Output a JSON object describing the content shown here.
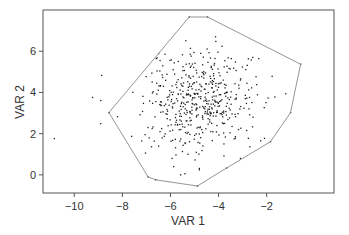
{
  "chart_data": {
    "type": "scatter",
    "title": "",
    "xlabel": "VAR 1",
    "ylabel": "VAR 2",
    "xlim": [
      -11.3,
      0.8
    ],
    "ylim": [
      -0.88,
      8.0
    ],
    "xticks": [
      -10,
      -8,
      -6,
      -4,
      -2
    ],
    "yticks": [
      0,
      2,
      4,
      6
    ],
    "grid": false,
    "legend": null,
    "point_color": "#222222",
    "hull_color": "#888888",
    "frame_color": "#555555",
    "cluster": {
      "description": "approx. bivariate normal cloud of ~500 points",
      "count": 500,
      "mean": [
        -4.75,
        3.55
      ],
      "sd": [
        1.15,
        1.25
      ],
      "seed": 7
    },
    "outliers": [
      {
        "x": -10.83,
        "y": 1.76
      },
      {
        "x": -9.24,
        "y": 3.76
      },
      {
        "x": -8.9,
        "y": 3.61
      },
      {
        "x": -8.86,
        "y": 4.83
      },
      {
        "x": -8.9,
        "y": 2.49
      }
    ],
    "hull": [
      {
        "x": -5.22,
        "y": 7.66
      },
      {
        "x": -4.46,
        "y": 7.66
      },
      {
        "x": -0.59,
        "y": 5.37
      },
      {
        "x": -1.01,
        "y": 3.02
      },
      {
        "x": -1.84,
        "y": 1.61
      },
      {
        "x": -3.66,
        "y": 0.34
      },
      {
        "x": -4.88,
        "y": -0.54
      },
      {
        "x": -6.62,
        "y": -0.24
      },
      {
        "x": -6.93,
        "y": -0.1
      },
      {
        "x": -8.56,
        "y": 3.02
      }
    ]
  },
  "layout": {
    "plot_left": 43,
    "plot_right": 334,
    "plot_top": 10,
    "plot_bottom": 193
  }
}
